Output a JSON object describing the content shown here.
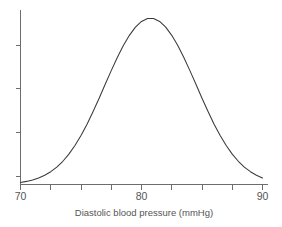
{
  "chart_data": {
    "type": "line",
    "title": "",
    "subtitle": "",
    "xlabel": "Diastolic blood pressure (mmHg)",
    "ylabel": "",
    "xlim": [
      70,
      90
    ],
    "ylim": [
      0,
      1
    ],
    "grid": false,
    "legend": null,
    "x_tick_labels": [
      "70",
      "80",
      "90"
    ],
    "x_labeled_ticks": [
      70,
      80,
      90
    ],
    "x_minor_ticks": [
      72.5,
      75,
      77.5,
      82.5,
      85,
      87.5
    ],
    "y_tick_labels": [],
    "y_ticks": [
      0,
      0.25,
      0.5,
      0.75
    ],
    "annotations": [],
    "distribution": {
      "shape": "normal",
      "mean": 80,
      "sd": 3.4,
      "peak_x": 80,
      "peak_y": 1.0
    },
    "x": [
      70,
      70.5,
      71,
      71.5,
      72,
      72.5,
      73,
      73.5,
      74,
      74.5,
      75,
      75.5,
      76,
      76.5,
      77,
      77.5,
      78,
      78.5,
      79,
      79.5,
      80,
      80.5,
      81,
      81.5,
      82,
      82.5,
      83,
      83.5,
      84,
      84.5,
      85,
      85.5,
      86,
      86.5,
      87,
      87.5,
      88,
      88.5,
      89,
      89.5,
      90
    ],
    "values": [
      0.011,
      0.017,
      0.025,
      0.036,
      0.051,
      0.07,
      0.095,
      0.127,
      0.166,
      0.213,
      0.268,
      0.33,
      0.399,
      0.472,
      0.548,
      0.623,
      0.695,
      0.76,
      0.816,
      0.861,
      0.892,
      0.908,
      0.908,
      0.892,
      0.861,
      0.816,
      0.76,
      0.695,
      0.623,
      0.548,
      0.472,
      0.399,
      0.33,
      0.268,
      0.213,
      0.166,
      0.127,
      0.095,
      0.07,
      0.051,
      0.036
    ],
    "series": [
      {
        "name": "Diastolic blood pressure distribution",
        "color": "#3a3a3a",
        "values": [
          0.011,
          0.017,
          0.025,
          0.036,
          0.051,
          0.07,
          0.095,
          0.127,
          0.166,
          0.213,
          0.268,
          0.33,
          0.399,
          0.472,
          0.548,
          0.623,
          0.695,
          0.76,
          0.816,
          0.861,
          0.892,
          0.908,
          0.908,
          0.892,
          0.861,
          0.816,
          0.76,
          0.695,
          0.623,
          0.548,
          0.472,
          0.399,
          0.33,
          0.268,
          0.213,
          0.166,
          0.127,
          0.095,
          0.07,
          0.051,
          0.036
        ]
      }
    ],
    "colors": {
      "curve": "#3a3a3a",
      "axis": "#6d6d6d",
      "text": "#555555",
      "background": "#ffffff"
    }
  },
  "axis": {
    "x_label": "Diastolic blood pressure (mmHg)",
    "tick_70": "70",
    "tick_80": "80",
    "tick_90": "90"
  }
}
